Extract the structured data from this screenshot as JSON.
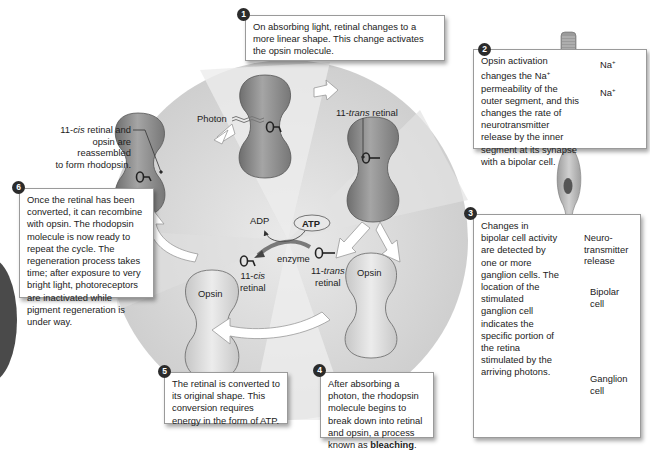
{
  "steps": [
    {
      "number": "1",
      "text": "On absorbing light, retinal changes to a more linear shape. This change activates the opsin molecule."
    },
    {
      "number": "2",
      "text_pre": "Opsin activation changes the Na",
      "text_sup": "+",
      "text_post": " permeability of the outer segment, and this changes the rate of neurotransmitter release by the inner segment at its synapse with a bipolar cell."
    },
    {
      "number": "3",
      "text": "Changes in bipolar cell activity are detected by one or more ganglion cells. The location of the stimulated ganglion cell indicates the specific portion of the retina stimulated by the arriving photons."
    },
    {
      "number": "4",
      "text_pre": "After absorbing a photon, the rhodopsin molecule begins to break down into retinal and opsin, a process known as ",
      "text_bold": "bleaching",
      "text_post": "."
    },
    {
      "number": "5",
      "text": "The retinal is converted to its original shape. This conversion requires energy in the form of ATP."
    },
    {
      "number": "6",
      "text": "Once the retinal has been converted, it can recombine with opsin. The rhodopsin molecule is now ready to repeat the cycle. The regeneration process takes time; after exposure to very bright light, photoreceptors are inactivated while pigment regeneration is under way."
    }
  ],
  "labels": {
    "reassembled_line1_a": "11-",
    "reassembled_line1_i": "cis",
    "reassembled_line1_b": " retinal and",
    "reassembled_line2": "opsin are reassembled",
    "reassembled_line3": "to form rhodopsin.",
    "photon": "Photon",
    "trans_retinal_top_a": "11-",
    "trans_retinal_top_i": "trans",
    "trans_retinal_top_b": " retinal",
    "adp": "ADP",
    "atp": "ATP",
    "enzyme": "enzyme",
    "cis_retinal_a": "11-",
    "cis_retinal_i": "cis",
    "cis_retinal_b": "retinal",
    "trans_retinal_a": "11-",
    "trans_retinal_i": "trans",
    "trans_retinal_b": "retinal",
    "opsin_left": "Opsin",
    "opsin_right": "Opsin",
    "na1": "Na",
    "na2": "Na",
    "na_sup": "+",
    "neurotransmitter_1": "Neuro-",
    "neurotransmitter_2": "transmitter",
    "neurotransmitter_3": "release",
    "bipolar_1": "Bipolar",
    "bipolar_2": "cell",
    "ganglion_1": "Ganglion",
    "ganglion_2": "cell"
  },
  "colors": {
    "wheel": "#d2d2d2",
    "wheel_light": "#e6e6e6",
    "rhodopsin": "#8f8f8f",
    "opsin": "#d9d9d9",
    "cell": "#bdbdbd",
    "nucleus": "#555555",
    "badge": "#2b2b2b"
  }
}
